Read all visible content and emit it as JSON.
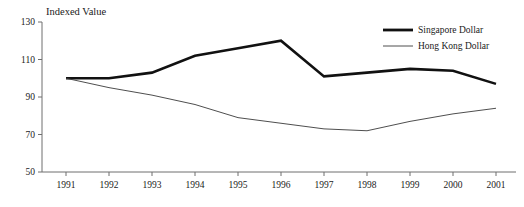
{
  "chart_data": {
    "type": "line",
    "title": "Indexed Value",
    "xlabel": "",
    "ylabel": "",
    "x": [
      1991,
      1992,
      1993,
      1994,
      1995,
      1996,
      1997,
      1998,
      1999,
      2000,
      2001
    ],
    "categories": [
      "1991",
      "1992",
      "1993",
      "1994",
      "1995",
      "1996",
      "1997",
      "1998",
      "1999",
      "2000",
      "2001"
    ],
    "ylim": [
      50,
      130
    ],
    "yticks": [
      50,
      70,
      90,
      110,
      130
    ],
    "yticklabels": [
      "50",
      "70",
      "90",
      "110",
      "130"
    ],
    "grid": false,
    "legend_position": "top-right",
    "series": [
      {
        "name": "Singapore Dollar",
        "style": "thick",
        "color": "#111111",
        "values": [
          100,
          100,
          103,
          112,
          116,
          120,
          101,
          103,
          105,
          104,
          97
        ]
      },
      {
        "name": "Hong Kong Dollar",
        "style": "thin",
        "color": "#3a3a3a",
        "values": [
          100,
          95,
          91,
          86,
          79,
          76,
          73,
          72,
          77,
          81,
          84
        ]
      }
    ]
  },
  "legend": {
    "entries": [
      {
        "label": "Singapore Dollar"
      },
      {
        "label": "Hong Kong Dollar"
      }
    ]
  }
}
